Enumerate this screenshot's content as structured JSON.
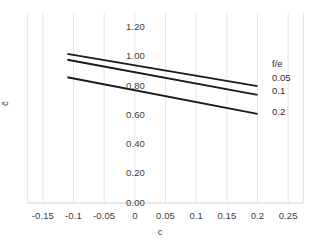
{
  "chart_data": {
    "type": "line",
    "title": "",
    "xlabel": "c",
    "ylabel": "c̄",
    "xlim": [
      -0.175,
      0.275
    ],
    "ylim": [
      0.0,
      1.3
    ],
    "grid": true,
    "grid_axis": "x",
    "legend_title": "f/e",
    "legend_position": "right-inside",
    "x_ticks": [
      "-0.15",
      "-0.1",
      "-0.05",
      "0",
      "0.05",
      "0.1",
      "0.15",
      "0.2",
      "0.25"
    ],
    "x_tick_values": [
      -0.15,
      -0.1,
      -0.05,
      0,
      0.05,
      0.1,
      0.15,
      0.2,
      0.25
    ],
    "y_ticks": [
      "0.00",
      "0.20",
      "0.40",
      "0.60",
      "0.80",
      "1.00",
      "1.20"
    ],
    "y_tick_values": [
      0.0,
      0.2,
      0.4,
      0.6,
      0.8,
      1.0,
      1.2
    ],
    "series": [
      {
        "name": "0.05",
        "x": [
          -0.11,
          0.2
        ],
        "values": [
          1.02,
          0.8
        ],
        "color": "#1a1a1a"
      },
      {
        "name": "0.1",
        "x": [
          -0.11,
          0.2
        ],
        "values": [
          0.98,
          0.74
        ],
        "color": "#1a1a1a"
      },
      {
        "name": "0.2",
        "x": [
          -0.11,
          0.2
        ],
        "values": [
          0.86,
          0.61
        ],
        "color": "#1a1a1a"
      }
    ]
  },
  "axes": {
    "x_title": "c",
    "y_title": "c̄"
  },
  "ticks": {
    "x": [
      "-0.15",
      "-0.1",
      "-0.05",
      "0",
      "0.05",
      "0.1",
      "0.15",
      "0.2",
      "0.25"
    ],
    "y": [
      "0.00",
      "0.20",
      "0.40",
      "0.60",
      "0.80",
      "1.00",
      "1.20"
    ]
  },
  "legend": {
    "title": "f/e",
    "items": [
      "0.05",
      "0.1",
      "0.2"
    ]
  },
  "colors": {
    "line": "#1a1a1a",
    "grid": "#e8e8ec",
    "axis_line": "#d0d0d4",
    "text": "#3c3c3c"
  }
}
